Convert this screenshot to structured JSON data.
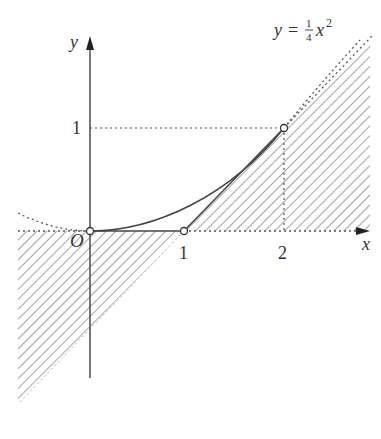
{
  "figure": {
    "equation_label": {
      "lhs": "y",
      "eq": "=",
      "frac_num": "1",
      "frac_den": "4",
      "var": "x",
      "exp": "2"
    },
    "axes": {
      "x_label": "x",
      "y_label": "y",
      "origin_label": "O"
    },
    "ticks": {
      "x": [
        "1",
        "2"
      ],
      "y": [
        "1"
      ]
    },
    "points": [
      {
        "name": "origin",
        "x": 0,
        "y": 0
      },
      {
        "name": "x-one",
        "x": 1,
        "y": 0
      },
      {
        "name": "curve-point",
        "x": 2,
        "y": 1
      }
    ],
    "colors": {
      "ink": "#333333",
      "hatch": "#888888",
      "dotted": "#555555"
    }
  }
}
